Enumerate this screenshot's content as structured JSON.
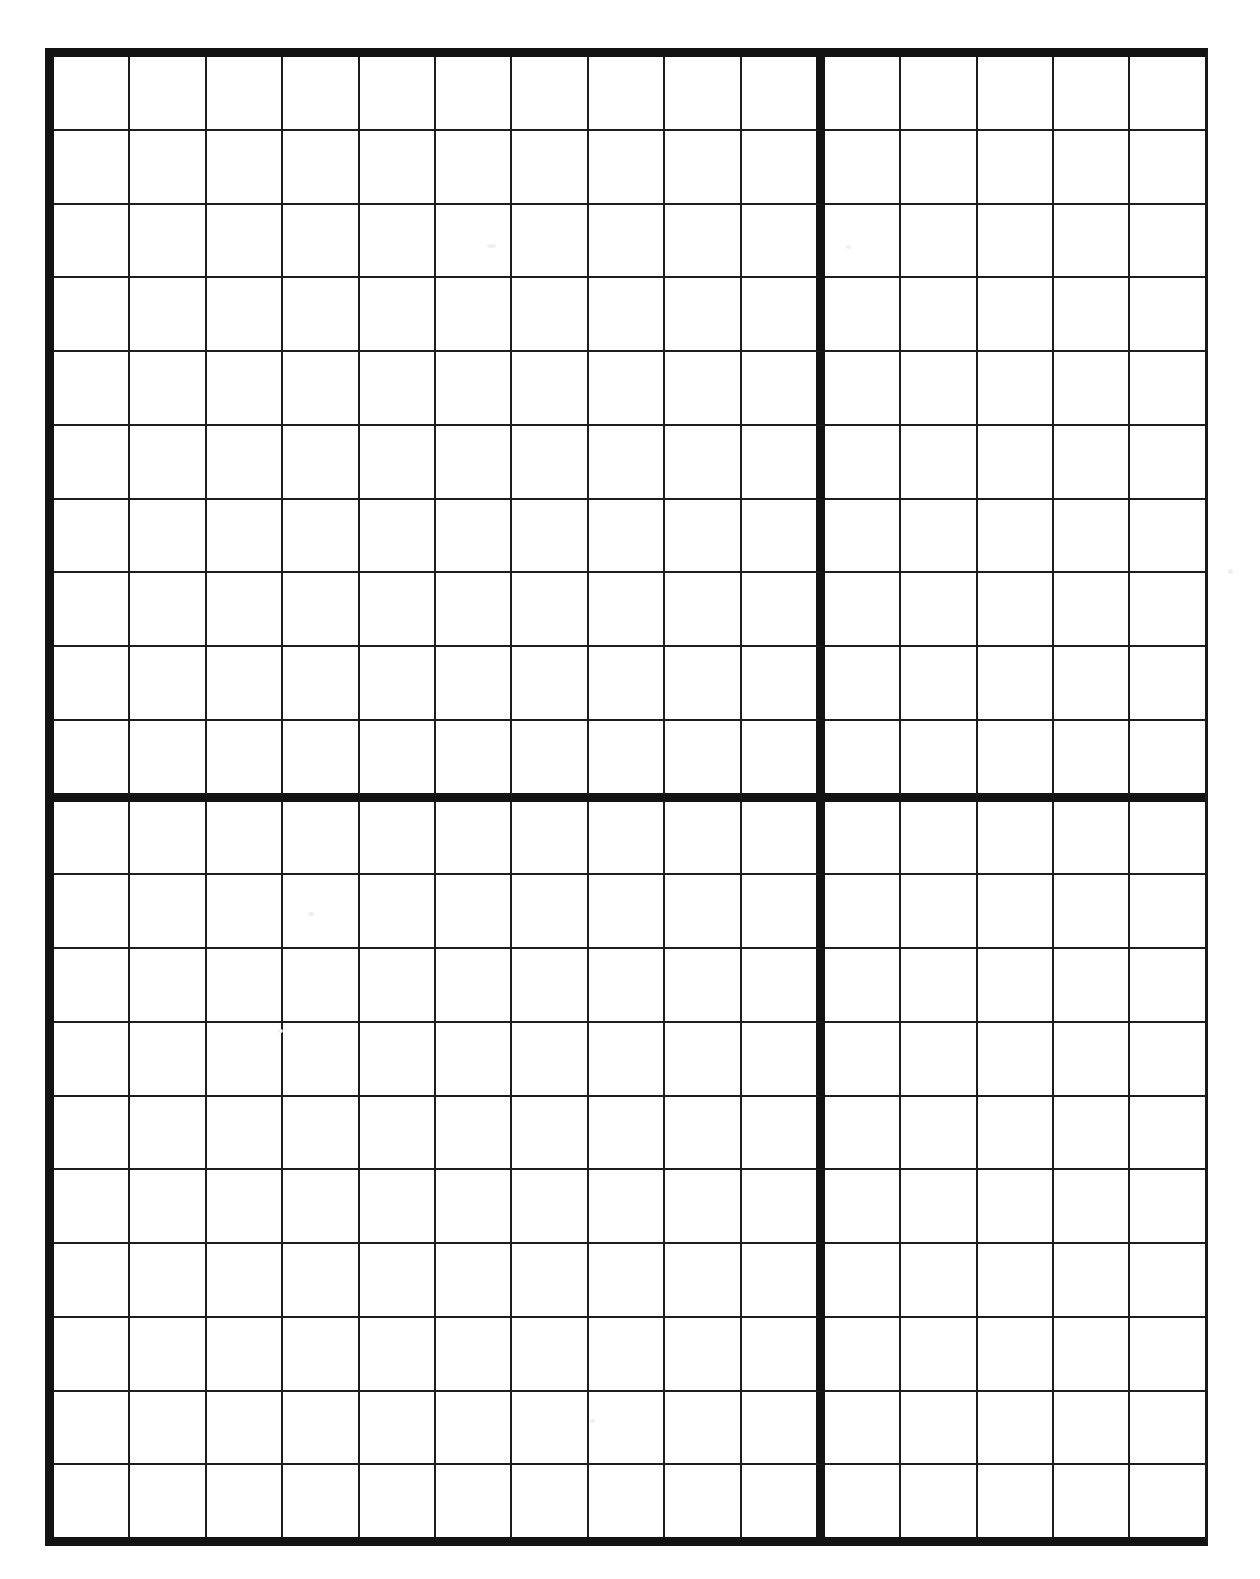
{
  "page": {
    "background_color": "#ffffff",
    "width_px": 1260,
    "height_px": 1579
  },
  "grid": {
    "name": "graph-paper-grid",
    "columns_total": 15,
    "rows_total": 20,
    "column_blocks": [
      10,
      5
    ],
    "row_blocks": [
      10,
      10
    ],
    "cell_width_px": 77.2,
    "cell_height_px": 74.45,
    "origin_x_px": 45,
    "origin_y_px": 48,
    "grid_width_px": 1163,
    "grid_height_px": 1498,
    "line_color": "#1d1d1d",
    "thin_line_width_px": 2,
    "heavy_line_color": "#131313",
    "heavy_line_width_px": 9,
    "outer_border": {
      "left_px": 9,
      "top_px": 9,
      "bottom_px": 9,
      "right_px": 3
    },
    "block_divider_vertical_after_column": 10,
    "block_divider_horizontal_after_row": 10,
    "cells_filled": 0,
    "labels": []
  },
  "chart_data": {
    "type": "table",
    "title": "",
    "columns": 15,
    "rows": 20,
    "categories": [],
    "values": [],
    "grid": true
  }
}
